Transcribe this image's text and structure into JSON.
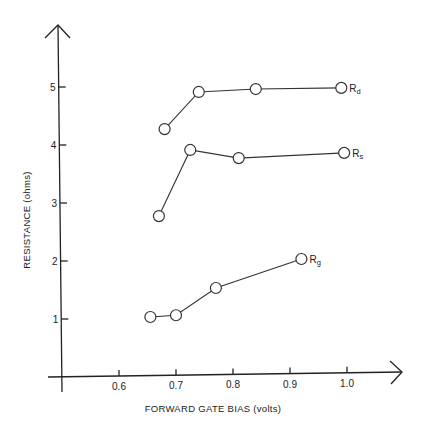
{
  "chart_data": {
    "type": "line",
    "title": "",
    "xlabel": "FORWARD GATE BIAS (volts)",
    "ylabel": "RESISTANCE (ohms)",
    "xlim": [
      0.5,
      1.1
    ],
    "ylim": [
      0,
      5.8
    ],
    "x_ticks": [
      0.6,
      0.7,
      0.8,
      0.9,
      1.0
    ],
    "x_tick_labels": [
      "0.6",
      "0.7",
      "0.8",
      "0.9",
      "1.0"
    ],
    "y_ticks": [
      1,
      2,
      3,
      4,
      5
    ],
    "y_tick_labels": [
      "1",
      "2",
      "3",
      "4",
      "5"
    ],
    "grid": false,
    "legend": "inline labels at series end",
    "series": [
      {
        "name": "Rd",
        "label_main": "R",
        "label_sub": "d",
        "x": [
          0.68,
          0.74,
          0.84,
          0.99
        ],
        "y": [
          4.24,
          4.88,
          4.93,
          4.95
        ]
      },
      {
        "name": "Rs",
        "label_main": "R",
        "label_sub": "s",
        "x": [
          0.67,
          0.725,
          0.81,
          0.995
        ],
        "y": [
          2.74,
          3.88,
          3.74,
          3.83
        ]
      },
      {
        "name": "Rg",
        "label_main": "R",
        "label_sub": "g",
        "x": [
          0.655,
          0.7,
          0.77,
          0.92
        ],
        "y": [
          1.0,
          1.03,
          1.5,
          2.0
        ]
      }
    ]
  },
  "layout": {
    "origin_x_value": 0.5,
    "x_px_at_origin": 62,
    "px_per_x_unit": 570,
    "y_px_at_zero": 375,
    "px_per_y_unit": 58,
    "marker_radius": 5.5
  }
}
